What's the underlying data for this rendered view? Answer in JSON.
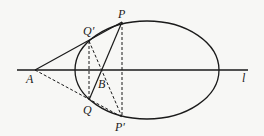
{
  "diagram": {
    "type": "geometry-ellipse",
    "labels": {
      "A": "A",
      "P": "P",
      "Q_prime": "Q′",
      "Q": "Q",
      "B": "B",
      "P_prime": "P′",
      "line": "l"
    },
    "points": {
      "A": [
        35,
        70
      ],
      "P": [
        122,
        22
      ],
      "Q_prime": [
        89,
        41
      ],
      "Q": [
        89,
        100
      ],
      "P_prime": [
        122,
        117
      ],
      "B": [
        102,
        70
      ]
    },
    "ellipse": {
      "cx": 147,
      "cy": 70,
      "rx": 72,
      "ry": 49
    },
    "line_l": {
      "x1": 17,
      "x2": 248,
      "y": 70
    },
    "colors": {
      "stroke": "#1a1a1a",
      "background": "#f7f7f5"
    }
  }
}
